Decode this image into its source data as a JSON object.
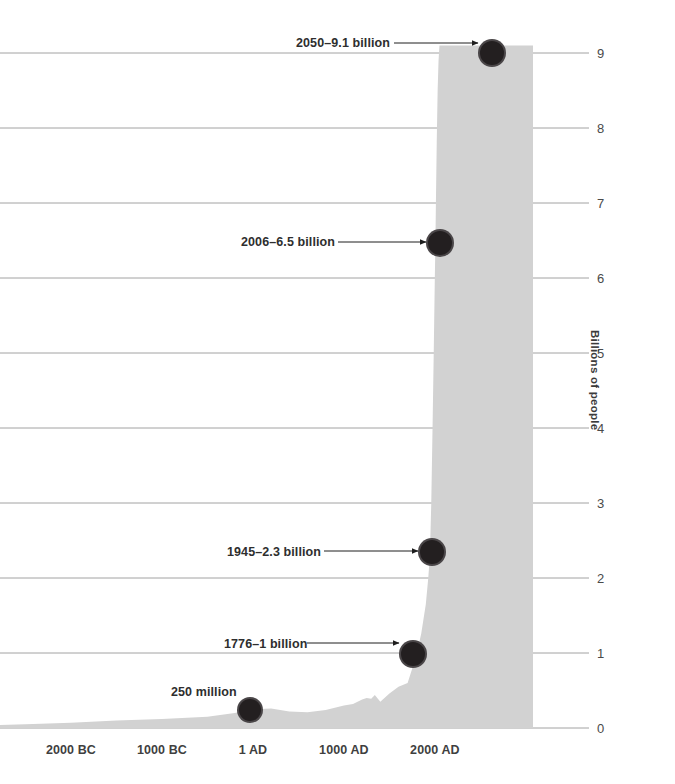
{
  "chart_data": {
    "type": "area",
    "title": "",
    "subtitle": "",
    "xlabel": "",
    "ylabel": "Billions of people",
    "xlim": [
      -5000,
      2200
    ],
    "ylim": [
      0,
      9.4
    ],
    "grid": true,
    "legend": false,
    "legend_position": "none",
    "area_color": "#d2d2d2",
    "gridline_color": "#8c8c8c",
    "marker_color": "#231f20",
    "background_color": "#ffffff",
    "x_ticks": [
      {
        "label": "2000 BC",
        "value": -2000
      },
      {
        "label": "1000 BC",
        "value": -1000
      },
      {
        "label": "1 AD",
        "value": 1
      },
      {
        "label": "1000 AD",
        "value": 1000
      },
      {
        "label": "2000 AD",
        "value": 2000
      }
    ],
    "y_ticks": [
      {
        "label": "0",
        "value": 0
      },
      {
        "label": "1",
        "value": 1
      },
      {
        "label": "2",
        "value": 2
      },
      {
        "label": "3",
        "value": 3
      },
      {
        "label": "4",
        "value": 4
      },
      {
        "label": "5",
        "value": 5
      },
      {
        "label": "6",
        "value": 6
      },
      {
        "label": "7",
        "value": 7
      },
      {
        "label": "8",
        "value": 8
      },
      {
        "label": "9",
        "value": 9
      }
    ],
    "series": [
      {
        "name": "World population",
        "units": "billions of people",
        "x": [
          -5000,
          -4000,
          -3000,
          -2500,
          -2000,
          -1500,
          -1000,
          -500,
          -200,
          1,
          200,
          400,
          600,
          800,
          1000,
          1100,
          1200,
          1250,
          1300,
          1340,
          1400,
          1500,
          1600,
          1700,
          1750,
          1776,
          1800,
          1850,
          1900,
          1927,
          1945,
          1960,
          1974,
          1987,
          1999,
          2006,
          2011,
          2020,
          2030,
          2040,
          2050
        ],
        "values": [
          0.02,
          0.03,
          0.04,
          0.05,
          0.07,
          0.1,
          0.12,
          0.15,
          0.2,
          0.25,
          0.26,
          0.22,
          0.21,
          0.24,
          0.3,
          0.32,
          0.38,
          0.4,
          0.39,
          0.44,
          0.35,
          0.46,
          0.55,
          0.6,
          0.79,
          1.0,
          0.99,
          1.26,
          1.65,
          2.0,
          2.3,
          3.0,
          4.0,
          5.0,
          6.0,
          6.5,
          7.0,
          7.8,
          8.5,
          8.9,
          9.1
        ]
      }
    ],
    "annotations": [
      {
        "label": "2050–9.1 billion",
        "year": 2050,
        "value": 9.1,
        "has_arrow": true,
        "label_left": 296,
        "label_top": 37,
        "arrow_from_x": 394,
        "arrow_to_x": 478,
        "arrow_y": 43,
        "dot_x": 492,
        "dot_y": 53,
        "dot_r": 14
      },
      {
        "label": "2006–6.5 billion",
        "year": 2006,
        "value": 6.5,
        "has_arrow": true,
        "label_left": 241,
        "label_top": 236,
        "arrow_from_x": 338,
        "arrow_to_x": 426,
        "arrow_y": 242,
        "dot_x": 440,
        "dot_y": 243,
        "dot_r": 14
      },
      {
        "label": "1945–2.3 billion",
        "year": 1945,
        "value": 2.3,
        "has_arrow": true,
        "label_left": 227,
        "label_top": 546,
        "arrow_from_x": 324,
        "arrow_to_x": 418,
        "arrow_y": 551,
        "dot_x": 432,
        "dot_y": 552,
        "dot_r": 14
      },
      {
        "label": "1776–1 billion",
        "year": 1776,
        "value": 1.0,
        "has_arrow": true,
        "label_left": 224,
        "label_top": 638,
        "arrow_from_x": 307,
        "arrow_to_x": 399,
        "arrow_y": 643,
        "dot_x": 413,
        "dot_y": 654,
        "dot_r": 14
      },
      {
        "label": "250 million",
        "year": 1,
        "value": 0.25,
        "has_arrow": false,
        "label_left": 171,
        "label_top": 686,
        "dot_x": 250,
        "dot_y": 710,
        "dot_r": 13
      }
    ]
  }
}
